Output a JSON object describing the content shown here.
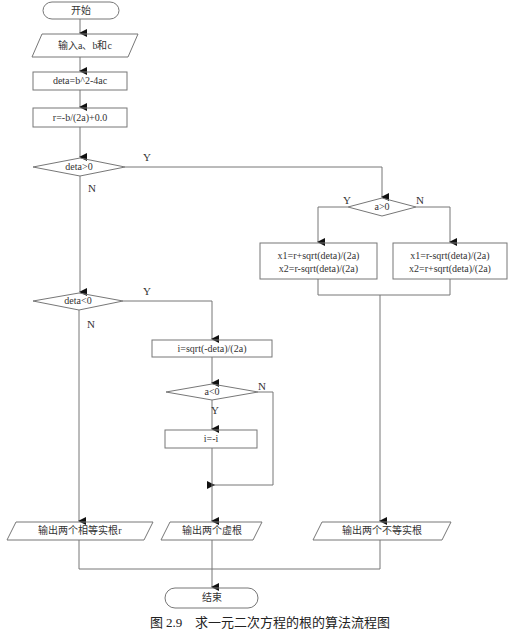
{
  "flowchart": {
    "start": "开始",
    "input": "输入a、b和c",
    "compute_deta": "deta=b^2-4ac",
    "compute_r": "r=-b/(2a)+0.0",
    "cond_deta_pos": "deta>0",
    "cond_deta_neg": "deta<0",
    "cond_a_pos": "a>0",
    "box_a_pos_line1": "x1=r+sqrt(deta)/(2a)",
    "box_a_pos_line2": "x2=r-sqrt(deta)/(2a)",
    "box_a_neg_line1": "x1=r-sqrt(deta)/(2a)",
    "box_a_neg_line2": "x2=r+sqrt(deta)/(2a)",
    "compute_i": "i=sqrt(-deta)/(2a)",
    "cond_a_neg": "a<0",
    "negate_i": "i=-i",
    "output_equal": "输出两个相等实根r",
    "output_imag": "输出两个虚根",
    "output_unequal": "输出两个不等实根",
    "end": "结束",
    "yes": "Y",
    "no": "N"
  },
  "caption": "图 2.9　求一元二次方程的根的算法流程图",
  "colors": {
    "line": "#555555",
    "text": "#333333",
    "background": "#ffffff"
  }
}
